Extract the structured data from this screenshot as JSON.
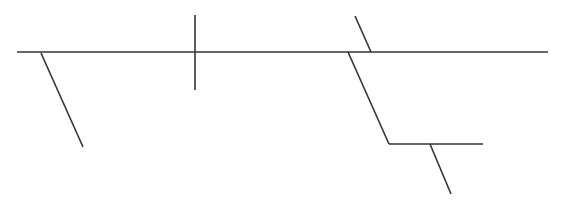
{
  "diagram": {
    "type": "sentence-diagram",
    "stroke_color": "#333333",
    "background": "#ffffff",
    "stroke_width": 1.6,
    "lines": [
      {
        "id": "baseline",
        "x1": 17,
        "y1": 52,
        "x2": 548,
        "y2": 52
      },
      {
        "id": "modifier-left",
        "x1": 41,
        "y1": 53,
        "x2": 83,
        "y2": 147
      },
      {
        "id": "subject-predicate-divider",
        "x1": 195,
        "y1": 15,
        "x2": 195,
        "y2": 90
      },
      {
        "id": "complement-slant",
        "x1": 355,
        "y1": 16,
        "x2": 371,
        "y2": 52
      },
      {
        "id": "prepositional-slant",
        "x1": 348,
        "y1": 52,
        "x2": 389,
        "y2": 144
      },
      {
        "id": "prepositional-object-line",
        "x1": 389,
        "y1": 144,
        "x2": 483,
        "y2": 144
      },
      {
        "id": "object-modifier",
        "x1": 430,
        "y1": 144,
        "x2": 451,
        "y2": 194
      }
    ]
  }
}
